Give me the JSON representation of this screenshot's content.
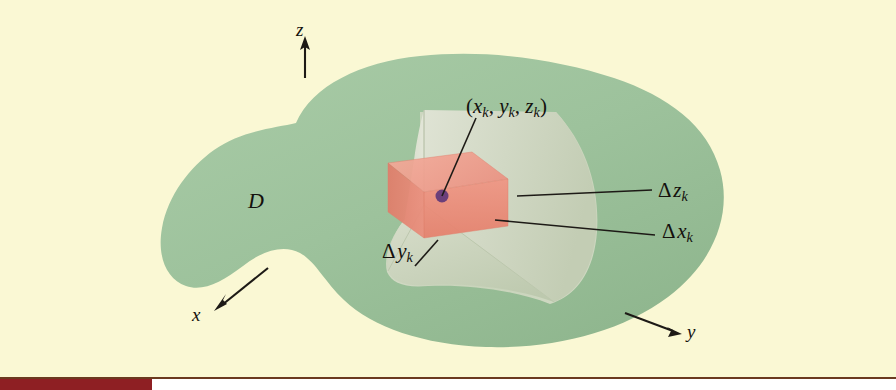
{
  "figure": {
    "kind": "math-diagram",
    "labels": {
      "region": "D",
      "sample_point": "(xₖ, yₖ, zₖ)",
      "sample_point_parts": {
        "open": "(",
        "x": "x",
        "sub_x": "k",
        "sep1": ", ",
        "y": "y",
        "sub_y": "k",
        "sep2": ", ",
        "z": "z",
        "sub_z": "k",
        "close": ")"
      },
      "delta_z": "Δzₖ",
      "delta_x": "Δxₖ",
      "delta_y": "Δyₖ",
      "delta_symbol": "Δ",
      "subscript_k": "k",
      "axis_z": "z",
      "axis_x": "x",
      "axis_y": "y"
    },
    "axes": [
      {
        "name": "z-axis",
        "label": "z",
        "direction": "up"
      },
      {
        "name": "x-axis",
        "label": "x",
        "direction": "down-left"
      },
      {
        "name": "y-axis",
        "label": "y",
        "direction": "down-right"
      }
    ],
    "colors": {
      "background": "#faf8d4",
      "solid_green": "#9dc29c",
      "solid_green_dark": "#8fb68e",
      "cut_plane_back": "#cfd8c2",
      "cut_plane_left": "#dfe2d2",
      "cut_plane_floor": "#c9d4ba",
      "cell_front": "#eb8b79",
      "cell_top": "#f2a494",
      "cell_side": "#e07b68",
      "sample_dot": "#6b3f7a",
      "leader_line": "#1d1a16",
      "rule_line": "#6b3a1f",
      "tab_maroon": "#8e1f23"
    }
  }
}
